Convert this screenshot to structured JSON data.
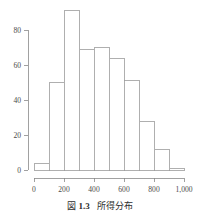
{
  "chart_data": {
    "type": "bar",
    "title": "所得分布",
    "xlabel": "",
    "ylabel": "",
    "categories": [
      "0-100",
      "100-200",
      "200-300",
      "300-400",
      "400-500",
      "500-600",
      "600-700",
      "700-800",
      "800-900",
      "900-1000"
    ],
    "bin_edges": [
      0,
      100,
      200,
      300,
      400,
      500,
      600,
      700,
      800,
      900,
      1000
    ],
    "values": [
      4,
      50,
      91,
      69,
      70,
      64,
      51,
      28,
      12,
      1
    ],
    "bin_width": 100,
    "xlim": [
      0,
      1000
    ],
    "ylim": [
      0,
      95
    ],
    "grid": false,
    "legend": false,
    "x_ticks": [
      0,
      200,
      400,
      600,
      800,
      1000
    ],
    "x_tick_labels": [
      "0",
      "200",
      "400",
      "600",
      "800",
      "1,000"
    ],
    "y_ticks": [
      0,
      20,
      40,
      60,
      80
    ],
    "y_tick_labels": [
      "0",
      "20",
      "40",
      "60",
      "80"
    ],
    "colors": {
      "bar_fill": "#ffffff",
      "bar_stroke": "#9b9b9b",
      "axis": "#8a8a8a",
      "text": "#4a4a4a",
      "background": "#ffffff"
    }
  },
  "caption": {
    "figure_word": "図",
    "number": "1.3",
    "title": "所得分布"
  }
}
